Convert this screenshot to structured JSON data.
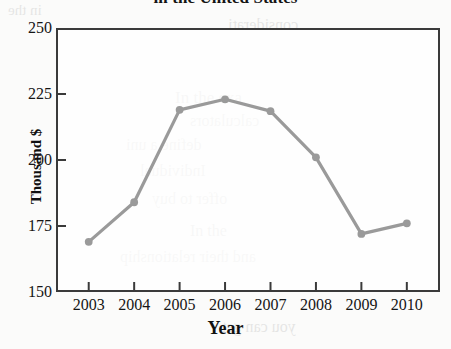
{
  "chart_data": {
    "type": "line",
    "title": "in the United States",
    "xlabel": "Year",
    "ylabel": "Thousand $",
    "categories": [
      "2003",
      "2004",
      "2005",
      "2006",
      "2007",
      "2008",
      "2009",
      "2010"
    ],
    "values": [
      169,
      184,
      219,
      223,
      218.5,
      201,
      172,
      176
    ],
    "ylim": [
      150,
      250
    ],
    "yticks": [
      "150",
      "175",
      "200",
      "225",
      "250"
    ],
    "ytick_values": [
      150,
      175,
      200,
      225,
      250
    ],
    "xlim": [
      2002.5,
      2010.5
    ],
    "grid": false,
    "legend": null,
    "series_color": "#9a9a9a",
    "marker": "circle",
    "axis_color": "#3a3a3a"
  },
  "background_text": {
    "lines": [
      "in the",
      "considerati",
      "In the exa",
      "calculators",
      "define a uni",
      "Individual",
      "offer to buy",
      "In the",
      "and their relationship",
      "you can get"
    ]
  }
}
